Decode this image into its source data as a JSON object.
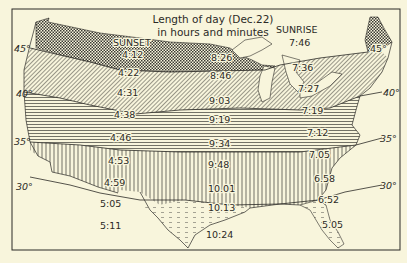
{
  "title": {
    "line1": "Length of day (Dec.22)",
    "line2": "in hours and minutes"
  },
  "headers": {
    "sunset": "SUNSET",
    "sunrise": "SUNRISE"
  },
  "latitudes": {
    "w45": "45°",
    "e45": "45°",
    "w40": "40°",
    "e40": "40°",
    "w35": "35°",
    "e35": "35°",
    "w30": "30°",
    "e30": "30°"
  },
  "sunset_times": [
    "4:12",
    "4:22",
    "4:31",
    "4:38",
    "4:46",
    "4:53",
    "4:59",
    "5:05",
    "5:11"
  ],
  "day_lengths": [
    "8:26",
    "8:46",
    "9:03",
    "9:19",
    "9:34",
    "9:48",
    "10.01",
    "10.13",
    "10:24"
  ],
  "sunrise_times": [
    "7:46",
    "7:36",
    "7:27",
    "7:19",
    "7:12",
    "7.05",
    "6.58",
    "6.52",
    "5.05"
  ],
  "colors": {
    "background": "#f8f5dc",
    "ink": "#2b2a26"
  }
}
